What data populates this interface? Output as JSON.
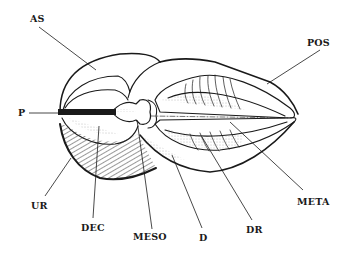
{
  "figure": {
    "type": "anatomical line drawing",
    "colors": {
      "ink": "#1a1a1a",
      "background": "#ffffff",
      "stipple": "#777777"
    }
  },
  "labels": {
    "as": {
      "text": "AS",
      "x": 30,
      "y": 14
    },
    "pos": {
      "text": "POS",
      "x": 307,
      "y": 38
    },
    "p": {
      "text": "P",
      "x": 18,
      "y": 108
    },
    "ur": {
      "text": "UR",
      "x": 31,
      "y": 201
    },
    "dec": {
      "text": "DEC",
      "x": 81,
      "y": 223
    },
    "meso": {
      "text": "MESO",
      "x": 133,
      "y": 232
    },
    "d": {
      "text": "D",
      "x": 199,
      "y": 233
    },
    "dr": {
      "text": "DR",
      "x": 246,
      "y": 225
    },
    "meta": {
      "text": "META",
      "x": 297,
      "y": 197
    }
  }
}
